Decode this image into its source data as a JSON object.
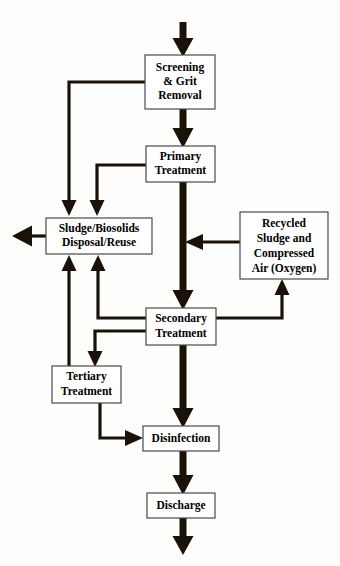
{
  "diagram": {
    "type": "flowchart",
    "background_color": "#fdfdfb",
    "line_color": "#1a1208",
    "box_fill": "#ffffff",
    "box_stroke": "#4a4a4a",
    "nodes": [
      {
        "id": "screening",
        "lines": [
          "Screening",
          "& Grit",
          "Removal"
        ],
        "x": 145,
        "y": 55,
        "w": 70,
        "h": 54,
        "font_size": 11.5
      },
      {
        "id": "primary",
        "lines": [
          "Primary",
          "Treatment"
        ],
        "x": 146,
        "y": 146,
        "w": 69,
        "h": 36,
        "font_size": 11.5
      },
      {
        "id": "sludge",
        "lines": [
          "Sludge/Biosolids",
          "Disposal/Reuse"
        ],
        "x": 46,
        "y": 218,
        "w": 106,
        "h": 36,
        "font_size": 11.5
      },
      {
        "id": "recycled",
        "lines": [
          "Recycled",
          "Sludge and",
          "Compressed",
          "Air (Oxygen)"
        ],
        "x": 240,
        "y": 212,
        "w": 88,
        "h": 67,
        "font_size": 11.5
      },
      {
        "id": "secondary",
        "lines": [
          "Secondary",
          "Treatment"
        ],
        "x": 146,
        "y": 308,
        "w": 70,
        "h": 37,
        "font_size": 11.5
      },
      {
        "id": "tertiary",
        "lines": [
          "Tertiary",
          "Treatment"
        ],
        "x": 52,
        "y": 366,
        "w": 69,
        "h": 37,
        "font_size": 11.5
      },
      {
        "id": "disinfection",
        "lines": [
          "Disinfection"
        ],
        "x": 143,
        "y": 426,
        "w": 76,
        "h": 25,
        "font_size": 11.5
      },
      {
        "id": "discharge",
        "lines": [
          "Discharge"
        ],
        "x": 147,
        "y": 493,
        "w": 68,
        "h": 25,
        "font_size": 11.5
      }
    ],
    "edges": [
      {
        "id": "influent-to-screening",
        "from": "influent",
        "to": "screening",
        "kind": "trunk"
      },
      {
        "id": "screening-to-primary",
        "from": "screening",
        "to": "primary",
        "kind": "trunk"
      },
      {
        "id": "screening-to-sludge",
        "from": "screening",
        "to": "sludge",
        "kind": "thin"
      },
      {
        "id": "primary-to-sludge",
        "from": "primary",
        "to": "sludge",
        "kind": "thin"
      },
      {
        "id": "primary-to-secondary",
        "from": "primary",
        "to": "secondary",
        "kind": "trunk"
      },
      {
        "id": "sludge-to-outlet",
        "from": "sludge",
        "to": "offsite",
        "kind": "thin"
      },
      {
        "id": "recycled-to-trunk",
        "from": "recycled",
        "to": "primary-effluent",
        "kind": "thin"
      },
      {
        "id": "secondary-to-recycled",
        "from": "secondary",
        "to": "recycled",
        "kind": "thin"
      },
      {
        "id": "secondary-to-sludge",
        "from": "secondary",
        "to": "sludge",
        "kind": "thin"
      },
      {
        "id": "secondary-to-tertiary",
        "from": "secondary",
        "to": "tertiary",
        "kind": "thin"
      },
      {
        "id": "tertiary-to-sludge",
        "from": "tertiary",
        "to": "sludge",
        "kind": "thin"
      },
      {
        "id": "tertiary-to-disinfection",
        "from": "tertiary",
        "to": "disinfection",
        "kind": "thin"
      },
      {
        "id": "secondary-to-disinfection",
        "from": "secondary",
        "to": "disinfection",
        "kind": "trunk"
      },
      {
        "id": "disinfection-to-discharge",
        "from": "disinfection",
        "to": "discharge",
        "kind": "trunk"
      },
      {
        "id": "discharge-to-receiving",
        "from": "discharge",
        "to": "receiving-water",
        "kind": "trunk"
      }
    ]
  }
}
